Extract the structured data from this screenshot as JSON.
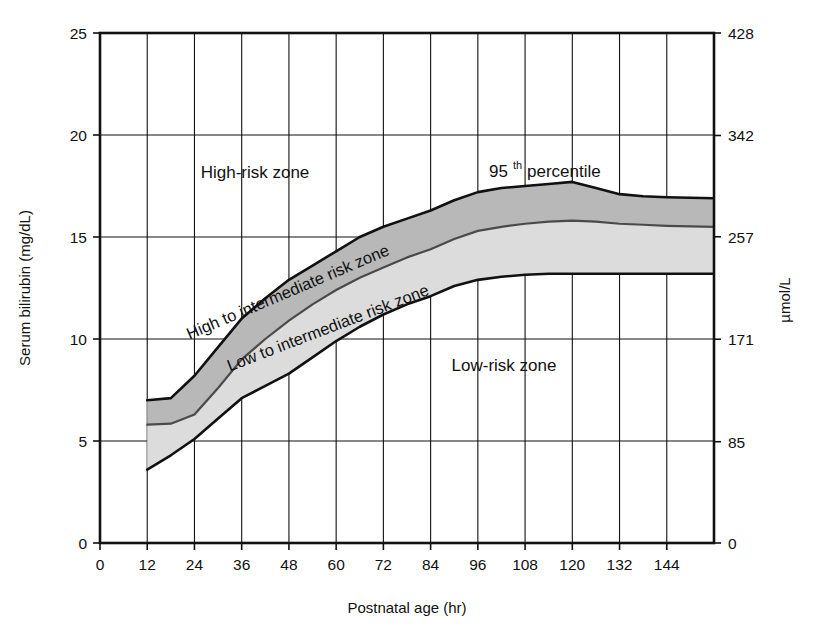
{
  "chart_data": {
    "type": "area",
    "title": "",
    "xlabel": "Postnatal age (hr)",
    "ylabel": "Serum bilirubin (mg/dL)",
    "ylabel_right": "µmol/L",
    "xlim": [
      0,
      156
    ],
    "ylim": [
      0,
      25
    ],
    "grid": true,
    "legend_position": "none",
    "xticks": [
      0,
      12,
      24,
      36,
      48,
      60,
      72,
      84,
      96,
      108,
      120,
      132,
      144
    ],
    "xticklabels": [
      "0",
      "12",
      "24",
      "36",
      "48",
      "60",
      "72",
      "84",
      "96",
      "108",
      "120",
      "132",
      "144"
    ],
    "yticks": [
      0,
      5,
      10,
      15,
      20,
      25
    ],
    "yticklabels": [
      "0",
      "5",
      "10",
      "15",
      "20",
      "25"
    ],
    "yticks_right": [
      0,
      85,
      171,
      257,
      342,
      428
    ],
    "yticklabels_right": [
      "0",
      "85",
      "171",
      "257",
      "342",
      "428"
    ],
    "x": [
      12,
      18,
      24,
      30,
      36,
      42,
      48,
      54,
      60,
      66,
      72,
      78,
      84,
      90,
      96,
      102,
      108,
      114,
      120,
      126,
      132,
      138,
      144,
      156
    ],
    "series": [
      {
        "name": "95th percentile (high-risk threshold)",
        "color": "#111111",
        "values": [
          7.0,
          7.1,
          8.2,
          9.6,
          11.0,
          12.0,
          12.9,
          13.6,
          14.3,
          15.0,
          15.5,
          15.9,
          16.3,
          16.8,
          17.2,
          17.4,
          17.5,
          17.6,
          17.7,
          17.4,
          17.1,
          17.0,
          16.95,
          16.9
        ]
      },
      {
        "name": "75th percentile (high-intermediate / low-intermediate boundary)",
        "color": "#111111",
        "values": [
          5.8,
          5.85,
          6.3,
          7.6,
          9.0,
          10.0,
          10.9,
          11.7,
          12.4,
          13.0,
          13.5,
          14.0,
          14.4,
          14.9,
          15.3,
          15.5,
          15.65,
          15.75,
          15.8,
          15.75,
          15.65,
          15.6,
          15.55,
          15.5
        ]
      },
      {
        "name": "40th percentile (low-risk threshold)",
        "color": "#111111",
        "values": [
          3.6,
          4.3,
          5.1,
          6.1,
          7.1,
          7.7,
          8.3,
          9.1,
          9.9,
          10.6,
          11.2,
          11.7,
          12.1,
          12.6,
          12.9,
          13.05,
          13.15,
          13.2,
          13.2,
          13.2,
          13.2,
          13.2,
          13.2,
          13.2
        ]
      }
    ],
    "bands": [
      {
        "name": "high-to-intermediate-risk-zone",
        "label": "High to intermediate risk zone",
        "between": [
          "95th percentile (high-risk threshold)",
          "75th percentile (high-intermediate / low-intermediate boundary)"
        ],
        "fill": "#b8b8b8"
      },
      {
        "name": "low-to-intermediate-risk-zone",
        "label": "Low to intermediate risk zone",
        "between": [
          "75th percentile (high-intermediate / low-intermediate boundary)",
          "40th percentile (low-risk threshold)"
        ],
        "fill": "#dcdcdc"
      }
    ],
    "annotations": [
      {
        "name": "high-risk-zone-label",
        "text": "High-risk zone",
        "x": 42,
        "y": 18.4,
        "rotation": 0
      },
      {
        "name": "percentile-label",
        "text": "95",
        "sup": "th",
        "text2": "percentile",
        "x": 111,
        "y": 18.3,
        "rotation": 0
      },
      {
        "name": "high-to-intermediate-label",
        "text": "High to intermediate risk zone",
        "rotation": -22
      },
      {
        "name": "low-to-intermediate-label",
        "text": "Low to intermediate risk zone",
        "rotation": -22
      },
      {
        "name": "low-risk-zone-label",
        "text": "Low-risk zone",
        "x": 112,
        "y": 8.6,
        "rotation": 0
      }
    ]
  },
  "axes": {
    "x_title": "Postnatal age (hr)",
    "y_title": "Serum bilirubin (mg/dL)",
    "y_title_right": "µmol/L"
  },
  "labels": {
    "high_risk": "High-risk zone",
    "low_risk": "Low-risk zone",
    "high_to_intermediate": "High to intermediate risk zone",
    "low_to_intermediate": "Low to intermediate risk zone",
    "percentile_num": "95",
    "percentile_sup": "th",
    "percentile_word": "percentile"
  }
}
